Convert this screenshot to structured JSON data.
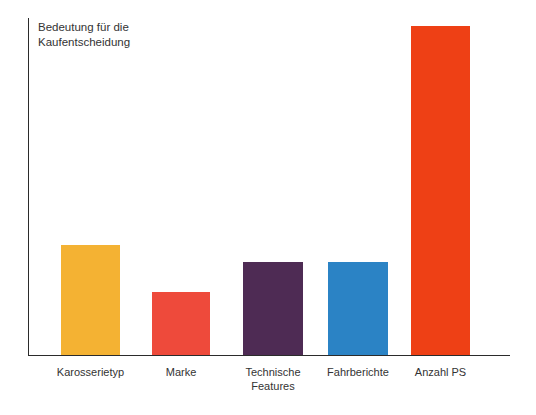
{
  "chart_data": {
    "type": "bar",
    "title": "",
    "ylabel": "Bedeutung für die\nKaufentscheidung",
    "xlabel": "",
    "categories": [
      "Karosserietyp",
      "Technische\nFeatures",
      "Marke",
      "Fahrberichte",
      "Anzahl PS"
    ],
    "grid": false,
    "legend": "none",
    "ylim": [
      0,
      337
    ],
    "axis_ticks": [],
    "bars": [
      {
        "label": "Karosserietyp",
        "value": 110,
        "color": "#F4B233",
        "left_px": 32,
        "width_px": 59
      },
      {
        "label": "Marke",
        "value": 63,
        "color": "#EE4A3B",
        "left_px": 123,
        "width_px": 58
      },
      {
        "label": "Technische\nFeatures",
        "value": 93,
        "color": "#4E2B54",
        "left_px": 214,
        "width_px": 60
      },
      {
        "label": "Fahrberichte",
        "value": 93,
        "color": "#2B83C5",
        "left_px": 299,
        "width_px": 60
      },
      {
        "label": "Anzahl PS",
        "value": 329,
        "color": "#EE4015",
        "left_px": 382,
        "width_px": 59
      }
    ]
  },
  "colors": {
    "axis": "#2b2b2b",
    "text": "#333333",
    "background": "#ffffff"
  }
}
